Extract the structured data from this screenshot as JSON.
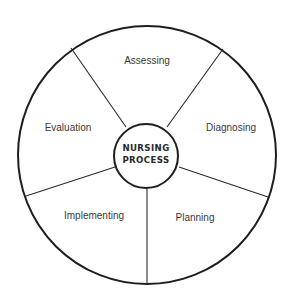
{
  "diagram": {
    "type": "cycle-wheel",
    "center": {
      "line1": "NURSING",
      "line2": "PROCESS"
    },
    "segments": [
      {
        "label": "Assessing",
        "position": "top"
      },
      {
        "label": "Diagnosing",
        "position": "right"
      },
      {
        "label": "Planning",
        "position": "bottom-right"
      },
      {
        "label": "Implementing",
        "position": "bottom-left"
      },
      {
        "label": "Evaluation",
        "position": "left"
      }
    ],
    "colors": {
      "stroke": "#1e1e1e",
      "text": "#3a3a3a",
      "background": "#ffffff"
    }
  }
}
